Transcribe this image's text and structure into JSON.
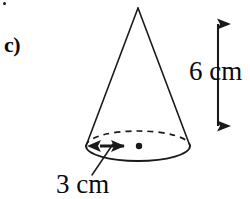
{
  "figure": {
    "type": "geometry-diagram",
    "shape": "cone",
    "part_label": "c)",
    "height_label": "6 cm",
    "radius_label": "3 cm",
    "stroke_color": "#1a1a1a",
    "background_color": "#ffffff",
    "annotations": {
      "height_value": 6,
      "height_unit": "cm",
      "radius_value": 3,
      "radius_unit": "cm"
    },
    "geometry": {
      "apex": {
        "x": 138,
        "y": 8
      },
      "base_center": {
        "x": 138,
        "y": 146
      },
      "base_rx": 52,
      "base_ry": 15,
      "height_arrow": {
        "x": 218,
        "y_top": 10,
        "y_bottom": 139
      },
      "radius_arrow": {
        "y": 146,
        "x_left": 87,
        "x_right": 136
      },
      "leader_line": {
        "x1": 92,
        "y1": 174,
        "x2": 112,
        "y2": 145
      }
    }
  }
}
